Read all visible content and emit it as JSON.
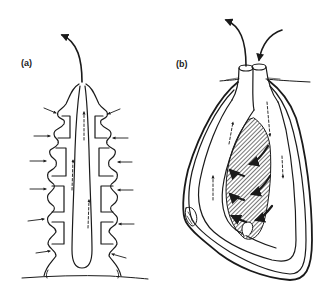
{
  "figure": {
    "panels": [
      {
        "id": "a",
        "label": "(a)",
        "description": "Elongated segmented tube body anchored in substrate; lateral inflow arrows at each segment, dashed internal upward flow arrows, single exhalant arrow leaving top"
      },
      {
        "id": "b",
        "label": "(b)",
        "description": "Bivalve-like body buried below surface with two siphons; inhalant arrow enters one siphon, exhalant arrow leaves the other; hatched gill with curved flow arrows; dashed circulation arrows inside mantle cavity"
      }
    ],
    "colors": {
      "line": "#1a1a1a",
      "background": "#ffffff",
      "hatch": "#2a2a2a"
    }
  }
}
